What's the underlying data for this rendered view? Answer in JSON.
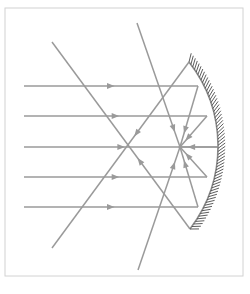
{
  "figure": {
    "caption": "",
    "background_color": "#ffffff",
    "frame": {
      "x": 5,
      "y": 8,
      "width": 238,
      "height": 268,
      "stroke_color": "#d2d2d2",
      "stroke_width": 1
    },
    "ray_color": "#9a9a9a",
    "mirror_color": "#8c8c8c",
    "hatch_color": "#4a4a4a"
  },
  "chart_data": {
    "type": "diagram",
    "xlabel": "",
    "ylabel": "",
    "focal_point": {
      "label": "F",
      "x": 180,
      "y": 147
    },
    "mirror": {
      "label": "concave mirror",
      "type": "arc",
      "top_end": {
        "x": 189,
        "y": 62
      },
      "vertex": {
        "x": 218,
        "y": 147
      },
      "bottom_end": {
        "x": 190,
        "y": 229
      },
      "hatch_marks": 58,
      "hatch_length": 9,
      "hatch_side": "outer"
    },
    "incident_rays": [
      {
        "name": "incident-ray-1",
        "x1": 24,
        "y1": 86,
        "x2": 198,
        "y2": 86,
        "arrow_at": 0.52
      },
      {
        "name": "incident-ray-2",
        "x1": 24,
        "y1": 116,
        "x2": 207,
        "y2": 116,
        "arrow_at": 0.52
      },
      {
        "name": "incident-ray-3",
        "x1": 24,
        "y1": 147,
        "x2": 218,
        "y2": 147,
        "arrow_at": 0.52
      },
      {
        "name": "incident-ray-4",
        "x1": 24,
        "y1": 177,
        "x2": 207,
        "y2": 177,
        "arrow_at": 0.52
      },
      {
        "name": "incident-ray-5",
        "x1": 24,
        "y1": 207,
        "x2": 198,
        "y2": 207,
        "arrow_at": 0.52
      }
    ],
    "reflected_rays": [
      {
        "name": "reflected-ray-1",
        "x1": 198,
        "y1": 86,
        "x2": 180,
        "y2": 147,
        "arrow_at": 0.78
      },
      {
        "name": "reflected-ray-2",
        "x1": 207,
        "y1": 116,
        "x2": 180,
        "y2": 147,
        "arrow_at": 0.8
      },
      {
        "name": "reflected-ray-3",
        "x1": 218,
        "y1": 147,
        "x2": 180,
        "y2": 147,
        "arrow_at": 0.8
      },
      {
        "name": "reflected-ray-4",
        "x1": 207,
        "y1": 177,
        "x2": 180,
        "y2": 147,
        "arrow_at": 0.8
      },
      {
        "name": "reflected-ray-5",
        "x1": 198,
        "y1": 207,
        "x2": 180,
        "y2": 147,
        "arrow_at": 0.78
      }
    ],
    "extended_rays": [
      {
        "name": "extended-ray-upper-left",
        "comment": "long diagonal from upper-left through focus to lower-right mirror edge",
        "x1": 52,
        "y1": 42,
        "x2": 190,
        "y2": 229,
        "arrow_at": 0.62,
        "arrow_reverse": true
      },
      {
        "name": "extended-ray-lower-left",
        "comment": "long diagonal from lower-left through focus to upper-right mirror edge",
        "x1": 52,
        "y1": 248,
        "x2": 189,
        "y2": 62,
        "arrow_at": 0.6,
        "arrow_reverse": true
      },
      {
        "name": "extended-ray-top-center",
        "comment": "steep diagonal entering from top-center toward the focus",
        "x1": 137,
        "y1": 23,
        "x2": 180,
        "y2": 147,
        "arrow_at": 0.88,
        "arrow_reverse": false
      },
      {
        "name": "extended-ray-bottom-center",
        "comment": "steep diagonal leaving the focus toward bottom-center",
        "x1": 180,
        "y1": 147,
        "x2": 138,
        "y2": 270,
        "arrow_at": 0.12,
        "arrow_reverse": true
      }
    ],
    "grid": false,
    "legend": null,
    "annotations": []
  }
}
